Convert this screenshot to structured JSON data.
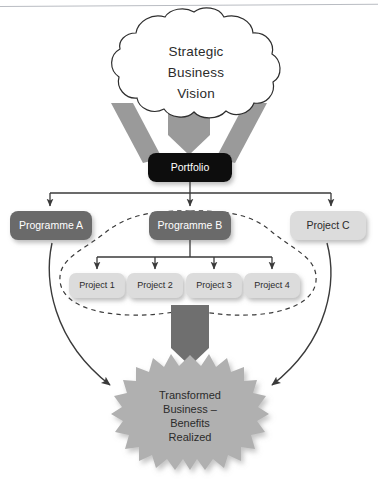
{
  "diagram": {
    "colors": {
      "portfolio_fill": "#0a0a0a",
      "programme_fill": "#6b6b6b",
      "light_box_fill": "#dcdcdc",
      "arrow_band_fill": "#9a9a9a",
      "thick_arrow_fill": "#6f6f6f",
      "star_fill": "#b0b0b0",
      "line_stroke": "#3a3a3a",
      "dashed_stroke": "#3a3a3a",
      "text_light": "#ffffff",
      "text_dark": "#2b2b2b"
    },
    "cloud": {
      "name": "strategic-business-vision",
      "lines": [
        "Strategic",
        "Business",
        "Vision"
      ]
    },
    "portfolio": {
      "name": "portfolio",
      "label": "Portfolio"
    },
    "level_two": [
      {
        "name": "programme-a",
        "label": "Programme A",
        "style": "dark"
      },
      {
        "name": "programme-b",
        "label": "Programme B",
        "style": "dark"
      },
      {
        "name": "project-c",
        "label": "Project C",
        "style": "light"
      }
    ],
    "projects": [
      {
        "name": "project-1",
        "label": "Project 1"
      },
      {
        "name": "project-2",
        "label": "Project 2"
      },
      {
        "name": "project-3",
        "label": "Project 3"
      },
      {
        "name": "project-4",
        "label": "Project 4"
      }
    ],
    "outcome": {
      "name": "transformed-business",
      "lines": [
        "Transformed",
        "Business –",
        "Benefits",
        "Realized"
      ]
    },
    "connectors": {
      "vision_to_portfolio": "three-gray-arrows",
      "portfolio_to_level_two": "tree-bus-three-branches",
      "programme_b_to_projects": "tree-bus-four-branches",
      "projects_to_outcome": "thick-down-arrow",
      "programme_a_to_outcome": "curved-arrow",
      "project_c_to_outcome": "curved-arrow",
      "programme_b_group": "dashed-blob-boundary"
    }
  }
}
